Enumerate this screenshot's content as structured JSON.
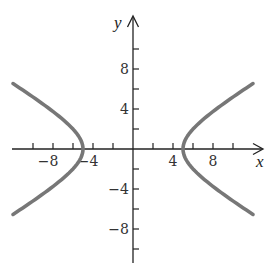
{
  "chart_data": {
    "type": "line",
    "title": "",
    "equation_estimate": "x^2/25 - y^2/9 = 1",
    "xlabel": "x",
    "ylabel": "y",
    "xlim": [
      -12,
      13
    ],
    "ylim": [
      -11,
      13
    ],
    "grid": false,
    "legend": null,
    "x_ticks": [
      -10,
      -8,
      -6,
      -4,
      -2,
      2,
      4,
      6,
      8,
      10
    ],
    "x_tick_labels": [
      {
        "value": -8,
        "text": "−8"
      },
      {
        "value": -4,
        "text": "−4"
      },
      {
        "value": 4,
        "text": "4"
      },
      {
        "value": 8,
        "text": "8"
      }
    ],
    "y_ticks": [
      -10,
      -8,
      -6,
      -4,
      -2,
      2,
      4,
      6,
      8,
      10
    ],
    "y_tick_labels": [
      {
        "value": 8,
        "text": "8"
      },
      {
        "value": 4,
        "text": "4"
      },
      {
        "value": -4,
        "text": "−4"
      },
      {
        "value": -8,
        "text": "−8"
      }
    ],
    "series": [
      {
        "name": "right branch",
        "vertex": [
          5,
          0
        ],
        "x_range": [
          5,
          12
        ],
        "endpoints": [
          [
            12,
            6.5
          ],
          [
            12,
            -6.5
          ]
        ]
      },
      {
        "name": "left branch",
        "vertex": [
          -5,
          0
        ],
        "x_range": [
          -12,
          -5
        ],
        "endpoints": [
          [
            -12,
            6.5
          ],
          [
            -12,
            -6.5
          ]
        ]
      }
    ],
    "a": 5,
    "b": 3,
    "curve_color": "#777777",
    "axis_color": "#222222"
  },
  "labels": {
    "x_axis": "x",
    "y_axis": "y",
    "xt_m8": "−8",
    "xt_m4": "−4",
    "xt_4": "4",
    "xt_8": "8",
    "yt_8": "8",
    "yt_4": "4",
    "yt_m4": "−4",
    "yt_m8": "−8"
  }
}
